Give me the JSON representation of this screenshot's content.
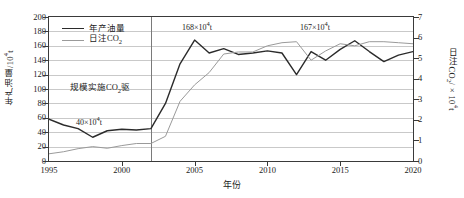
{
  "chart_data": {
    "type": "line",
    "title": "",
    "xlabel": "年份",
    "ylabel": "年产油量/10⁴t",
    "ylabel_right": "日注CO₂/×10⁴t",
    "xlim": [
      1995,
      2020
    ],
    "ylim": [
      0,
      200
    ],
    "ylim_right": [
      0,
      7
    ],
    "grid": true,
    "legend_position": "top-left",
    "xticks": [
      "1995",
      "2000",
      "2005",
      "2010",
      "2015",
      "2020"
    ],
    "yticks": [
      "0",
      "20",
      "40",
      "60",
      "80",
      "100",
      "120",
      "140",
      "160",
      "180",
      "200"
    ],
    "yticks_right": [
      "0",
      "1",
      "2",
      "3",
      "4",
      "5",
      "6",
      "7"
    ],
    "x": [
      1995,
      1996,
      1997,
      1998,
      1999,
      2000,
      2001,
      2002,
      2003,
      2004,
      2005,
      2006,
      2007,
      2008,
      2009,
      2010,
      2011,
      2012,
      2013,
      2014,
      2015,
      2016,
      2017,
      2018,
      2019,
      2020
    ],
    "series": [
      {
        "name": "年产油量",
        "axis": "left",
        "color": "#2b2b2b",
        "values": [
          58,
          50,
          45,
          33,
          42,
          44,
          43,
          45,
          80,
          135,
          168,
          150,
          156,
          148,
          150,
          153,
          150,
          120,
          152,
          140,
          155,
          167,
          152,
          138,
          147,
          152
        ]
      },
      {
        "name": "日注CO₂",
        "axis": "right",
        "color": "#9a9a9a",
        "values": [
          0.35,
          0.45,
          0.6,
          0.7,
          0.62,
          0.75,
          0.85,
          0.85,
          1.2,
          2.9,
          3.7,
          4.3,
          5.2,
          5.3,
          5.3,
          5.6,
          5.75,
          5.8,
          4.9,
          5.35,
          5.7,
          5.6,
          5.8,
          5.8,
          5.75,
          5.7
        ]
      }
    ],
    "annotations": [
      {
        "name": "peak-168",
        "text": "168×10⁴t",
        "x": 2005,
        "y": 185
      },
      {
        "name": "peak-167",
        "text": "167×10⁴t",
        "x": 2016,
        "y": 185
      },
      {
        "name": "baseline-40",
        "text": "40×10⁴t",
        "x": 2000,
        "y": 52
      },
      {
        "name": "regime-label",
        "text": "规模实施CO₂驱",
        "x": 1999,
        "y": 95
      }
    ],
    "vertical_marker": {
      "name": "co2-flood-start",
      "x": 2002
    }
  },
  "legend": {
    "items": [
      {
        "label": "年产油量",
        "color": "#2b2b2b",
        "width": "1.6px"
      },
      {
        "label": "日注CO₂",
        "color": "#9a9a9a",
        "width": "1.2px"
      }
    ]
  },
  "axis_titles": {
    "x": "年份",
    "y_left_main": "年产油量/10",
    "y_left_sup": "4",
    "y_left_unit": "t",
    "y_right_main": "日注CO",
    "y_right_sub": "2",
    "y_right_unit": "/×10",
    "y_right_sup": "4",
    "y_right_unit2": "t"
  },
  "annotations_text": {
    "regime_a": "规模实施CO",
    "regime_sub": "2",
    "regime_b": "驱",
    "v40": "40×10",
    "v40_sup": "4",
    "v40_t": "t",
    "v168": "168×10",
    "v168_sup": "4",
    "v168_t": "t",
    "v167": "167×10",
    "v167_sup": "4",
    "v167_t": "t"
  },
  "colors": {
    "oil_line": "#2b2b2b",
    "co2_line": "#9a9a9a",
    "grid": "#c9c9c9",
    "frame": "#3a3a3a",
    "divider": "#7a7a7a"
  }
}
